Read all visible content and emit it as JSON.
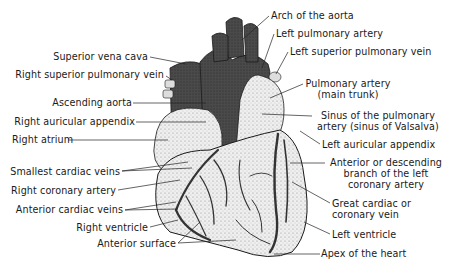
{
  "diagram": {
    "colors": {
      "vessel_dark": "#3a3a3a",
      "tissue_light": "#e6e6e6",
      "outline": "#1a1a1a",
      "leader": "#222222"
    },
    "labels_left": [
      {
        "id": "superior-vena-cava",
        "text": "Superior vena cava"
      },
      {
        "id": "right-superior-pulmonary-vein",
        "text": "Right superior pulmonary vein"
      },
      {
        "id": "ascending-aorta",
        "text": "Ascending aorta"
      },
      {
        "id": "right-auricular-appendix",
        "text": "Right auricular appendix"
      },
      {
        "id": "right-atrium",
        "text": "Right atrium"
      },
      {
        "id": "smallest-cardiac-veins",
        "text": "Smallest cardiac veins"
      },
      {
        "id": "right-coronary-artery",
        "text": "Right coronary artery"
      },
      {
        "id": "anterior-cardiac-veins",
        "text": "Anterior cardiac veins"
      },
      {
        "id": "right-ventricle",
        "text": "Right ventricle"
      },
      {
        "id": "anterior-surface",
        "text": "Anterior surface"
      }
    ],
    "labels_right": [
      {
        "id": "arch-of-the-aorta",
        "text": "Arch of the aorta"
      },
      {
        "id": "left-pulmonary-artery",
        "text": "Left pulmonary artery"
      },
      {
        "id": "left-superior-pulmonary-vein",
        "text": "Left superior pulmonary vein"
      },
      {
        "id": "pulmonary-artery",
        "line1": "Pulmonary artery",
        "line2": "(main trunk)"
      },
      {
        "id": "sinus-of-pulmonary-artery",
        "line1": "Sinus of the pulmonary",
        "line2": "artery (sinus of Valsalva)"
      },
      {
        "id": "left-auricular-appendix",
        "text": "Left auricular appendix"
      },
      {
        "id": "anterior-descending-branch",
        "line1": "Anterior or descending",
        "line2": "branch of the left",
        "line3": "coronary artery"
      },
      {
        "id": "great-cardiac-vein",
        "line1": "Great cardiac or",
        "line2": "coronary vein"
      },
      {
        "id": "left-ventricle",
        "text": "Left ventricle"
      },
      {
        "id": "apex-of-the-heart",
        "text": "Apex of the heart"
      }
    ]
  }
}
